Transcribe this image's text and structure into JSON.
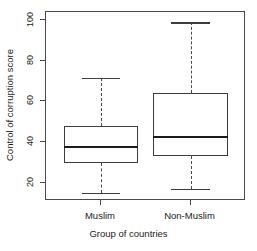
{
  "chart_data": {
    "type": "box",
    "title": "",
    "xlabel": "Group of countries",
    "ylabel": "Control of corruption score",
    "ylim": [
      11,
      104
    ],
    "yticks": [
      20,
      40,
      60,
      80,
      100
    ],
    "ytick_labels": [
      "20",
      "40",
      "60",
      "80",
      "100"
    ],
    "grid": false,
    "legend": "none",
    "categories": [
      "Muslim",
      "Non-Muslim"
    ],
    "boxes": [
      {
        "name": "Muslim",
        "min": 15,
        "q1": 29.5,
        "median": 37.5,
        "q3": 48,
        "max": 71.5
      },
      {
        "name": "Non-Muslim",
        "min": 17,
        "q1": 33,
        "median": 42.5,
        "q3": 64,
        "max": 99
      }
    ]
  },
  "axis": {
    "y_title": "Control of corruption score",
    "x_title": "Group of countries",
    "y_ticks": [
      "20",
      "40",
      "60",
      "80",
      "100"
    ],
    "x_ticks": [
      "Muslim",
      "Non-Muslim"
    ]
  },
  "colors": {
    "box_stroke": "#3d3d3d",
    "median": "#1c1c1c",
    "whisker": "#4a4a4a",
    "frame": "#4a4a4a",
    "background": "#ffffff"
  }
}
